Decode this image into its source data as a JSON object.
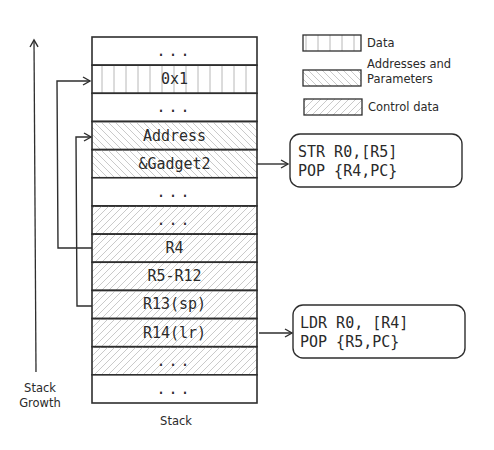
{
  "diagram": {
    "title": "Stack",
    "growth_label": [
      "Stack",
      "Growth"
    ],
    "legend": [
      {
        "label_lines": [
          "Data"
        ],
        "pattern": "vertical"
      },
      {
        "label_lines": [
          "Addresses and",
          "Parameters"
        ],
        "pattern": "backslash"
      },
      {
        "label_lines": [
          "Control data"
        ],
        "pattern": "slash"
      }
    ],
    "stack_rows": [
      {
        "label": "...",
        "pattern": "none"
      },
      {
        "label": "0x1",
        "pattern": "vertical"
      },
      {
        "label": "...",
        "pattern": "none"
      },
      {
        "label": "Address",
        "pattern": "backslash"
      },
      {
        "label": "&Gadget2",
        "pattern": "backslash"
      },
      {
        "label": "...",
        "pattern": "none"
      },
      {
        "label": "...",
        "pattern": "slash"
      },
      {
        "label": "R4",
        "pattern": "slash"
      },
      {
        "label": "R5-R12",
        "pattern": "slash"
      },
      {
        "label": "R13(sp)",
        "pattern": "slash"
      },
      {
        "label": "R14(lr)",
        "pattern": "slash"
      },
      {
        "label": "...",
        "pattern": "slash"
      },
      {
        "label": "...",
        "pattern": "none"
      }
    ],
    "gadgets": [
      {
        "from_row": "&Gadget2",
        "lines": [
          "STR R0,[R5]",
          "POP {R4,PC}"
        ]
      },
      {
        "from_row": "R14(lr)",
        "lines": [
          "LDR R0, [R4]",
          "POP {R5,PC}"
        ]
      }
    ],
    "pointers": [
      {
        "from_row": "R4",
        "to_row": "0x1"
      },
      {
        "from_row": "R13(sp)",
        "to_row": "Address"
      }
    ]
  }
}
